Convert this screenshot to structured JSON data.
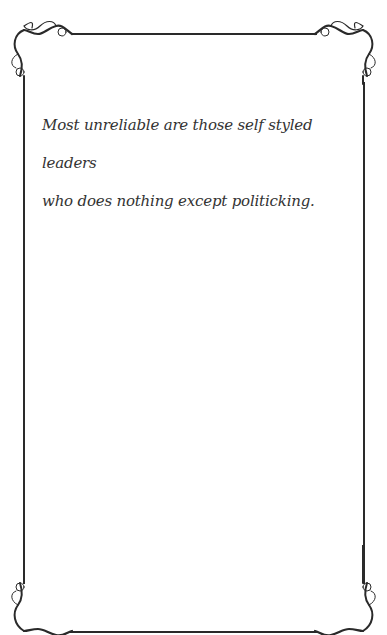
{
  "card": {
    "quote_lines": [
      "Most unreliable are those self styled leaders",
      "who does nothing except politicking."
    ]
  },
  "colors": {
    "frame": "#2a2a2a",
    "text": "#333333",
    "background": "#ffffff"
  }
}
